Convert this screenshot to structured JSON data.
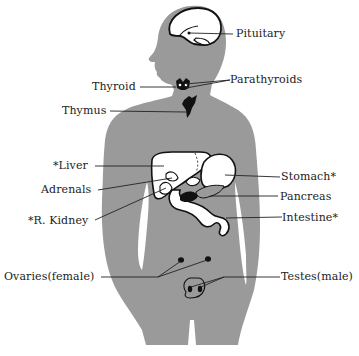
{
  "diagram": {
    "type": "anatomical-illustration",
    "colors": {
      "body": "#9a9a9a",
      "organ_fill": "#ffffff",
      "outline": "#111111",
      "text": "#222222",
      "background": "#ffffff"
    },
    "labels": {
      "pituitary": "Pituitary",
      "parathyroids": "Parathyroids",
      "thyroid": "Thyroid",
      "thymus": "Thymus",
      "liver": "*Liver",
      "adrenals": "Adrenals",
      "r_kidney": "*R. Kidney",
      "stomach": "Stomach*",
      "pancreas": "Pancreas",
      "intestine": "Intestine*",
      "ovaries": "Ovaries(female)",
      "testes": "Testes(male)"
    }
  }
}
